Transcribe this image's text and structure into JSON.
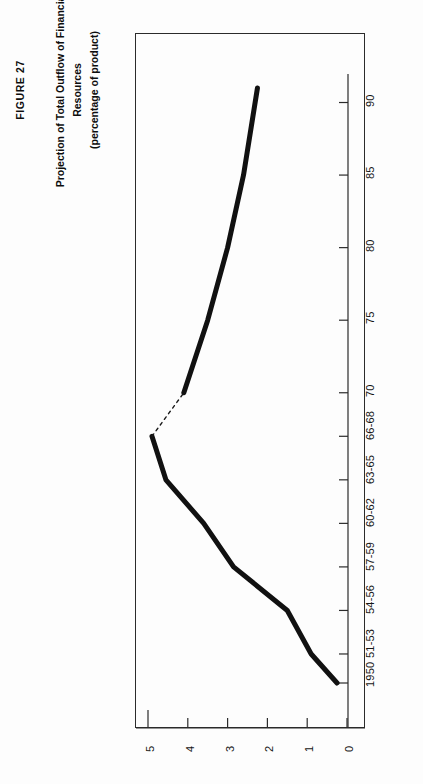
{
  "figure": {
    "number": "FIGURE 27",
    "title_line1": "Projection of Total Outflow of Financial",
    "title_line2": "Resources",
    "title_line3": "(percentage of product)"
  },
  "chart_data": {
    "type": "line",
    "title": "Projection of Total Outflow of Financial Resources",
    "subtitle": "(percentage of product)",
    "xlabel": "",
    "ylabel": "percentage of product",
    "orientation": "rotated-90-ccw",
    "xlim": [
      1950,
      1991
    ],
    "ylim": [
      0,
      5
    ],
    "grid": false,
    "legend": "none",
    "x_tick_labels": [
      "1950",
      "51-53",
      "54-56",
      "57-59",
      "60-62",
      "63-65",
      "66-68",
      "70",
      "75",
      "80",
      "85",
      "90"
    ],
    "x_tick_values": [
      1950,
      1952,
      1955,
      1958,
      1961,
      1964,
      1967,
      1970,
      1975,
      1980,
      1985,
      1990
    ],
    "y_tick_labels": [
      "0",
      "1",
      "2",
      "3",
      "4",
      "5"
    ],
    "y_tick_values": [
      0,
      1,
      2,
      3,
      4,
      5
    ],
    "series": [
      {
        "name": "Historical outflow",
        "style": "solid",
        "line_width": "heavy",
        "color": "#111111",
        "points": [
          {
            "x": 1950,
            "label": "1950",
            "y": 0.25
          },
          {
            "x": 1952,
            "label": "51-53",
            "y": 0.9
          },
          {
            "x": 1955,
            "label": "54-56",
            "y": 1.5
          },
          {
            "x": 1958,
            "label": "57-59",
            "y": 2.85
          },
          {
            "x": 1961,
            "label": "60-62",
            "y": 3.6
          },
          {
            "x": 1964,
            "label": "63-65",
            "y": 4.55
          },
          {
            "x": 1967,
            "label": "66-68",
            "y": 4.9
          }
        ]
      },
      {
        "name": "Interpolated link",
        "style": "dashed",
        "line_width": "thin",
        "color": "#1a1a1a",
        "points": [
          {
            "x": 1967,
            "label": "66-68",
            "y": 4.9
          },
          {
            "x": 1970,
            "label": "70",
            "y": 4.1
          }
        ]
      },
      {
        "name": "Projection",
        "style": "solid",
        "line_width": "heavy",
        "color": "#111111",
        "points": [
          {
            "x": 1970,
            "label": "70",
            "y": 4.1
          },
          {
            "x": 1975,
            "label": "75",
            "y": 3.5
          },
          {
            "x": 1980,
            "label": "80",
            "y": 3.0
          },
          {
            "x": 1985,
            "label": "85",
            "y": 2.6
          },
          {
            "x": 1991,
            "label": "90",
            "y": 2.25
          }
        ]
      }
    ]
  },
  "axes": {
    "x_axis_name": "year-axis",
    "y_axis_name": "percentage-axis"
  }
}
